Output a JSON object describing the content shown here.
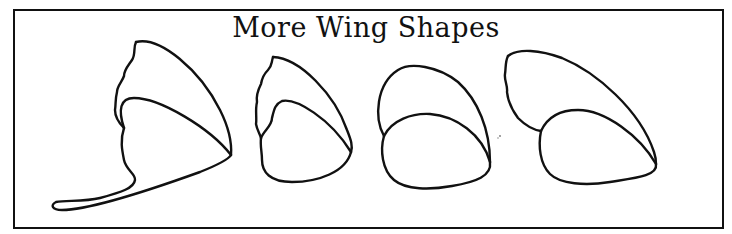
{
  "title": "More Wing Shapes",
  "colors": {
    "ink": "#111111",
    "background": "#ffffff"
  },
  "shapes": [
    {
      "id": "wing-shape-1",
      "description": "swallowtail wing with wavy forewing and long tail"
    },
    {
      "id": "wing-shape-2",
      "description": "small wing with wavy forewing edge"
    },
    {
      "id": "wing-shape-3",
      "description": "rounded smooth wing"
    },
    {
      "id": "wing-shape-4",
      "description": "long forewing with rounded hindwing"
    }
  ]
}
